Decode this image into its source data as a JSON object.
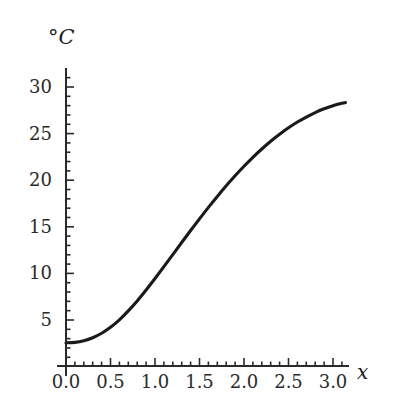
{
  "figure": {
    "title": "",
    "background_color": "#ffffff",
    "curve_color": "#1a1a1a",
    "axis_color": "#2a2a2a"
  },
  "axes": {
    "y_axis_label": "°C",
    "x_axis_label": "x"
  },
  "chart_data": {
    "type": "line",
    "title": "",
    "xlabel": "x",
    "ylabel": "°C",
    "xlim": [
      0.0,
      3.18
    ],
    "ylim": [
      0,
      31.5
    ],
    "xticks": [
      0.0,
      0.5,
      1.0,
      1.5,
      2.0,
      2.5,
      3.0
    ],
    "xticklabels": [
      "0.0",
      "0.5",
      "1.0",
      "1.5",
      "2.0",
      "2.5",
      "3.0"
    ],
    "yticks": [
      5,
      10,
      15,
      20,
      25,
      30
    ],
    "yticklabels": [
      "5",
      "10",
      "15",
      "20",
      "25",
      "30"
    ],
    "x_minor_tick_step": 0.1,
    "y_minor_tick_step": 1,
    "grid": false,
    "legend": false,
    "legend_position": "none",
    "series": [
      {
        "name": "temperature",
        "x": [
          0.0,
          0.1,
          0.2,
          0.3,
          0.4,
          0.5,
          0.6,
          0.7,
          0.8,
          0.9,
          1.0,
          1.1,
          1.2,
          1.3,
          1.4,
          1.5,
          1.6,
          1.7,
          1.8,
          1.9,
          2.0,
          2.1,
          2.2,
          2.3,
          2.4,
          2.5,
          2.6,
          2.7,
          2.8,
          2.9,
          3.0,
          3.1,
          3.14
        ],
        "y": [
          2.55,
          2.6,
          2.78,
          3.1,
          3.58,
          4.22,
          5.02,
          5.98,
          7.05,
          8.22,
          9.45,
          10.72,
          12.02,
          13.32,
          14.6,
          15.85,
          17.08,
          18.26,
          19.4,
          20.48,
          21.5,
          22.46,
          23.35,
          24.18,
          24.93,
          25.62,
          26.24,
          26.78,
          27.26,
          27.66,
          27.99,
          28.25,
          28.33
        ]
      }
    ]
  }
}
